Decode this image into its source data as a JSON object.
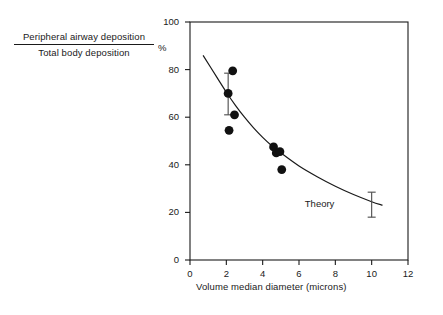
{
  "chart_data": {
    "type": "scatter",
    "title": "",
    "ylabel_numerator": "Peripheral airway deposition",
    "ylabel_denominator": "Total body deposition",
    "ylabel_unit": "%",
    "xlabel": "Volume median diameter  (microns)",
    "xlim": [
      0,
      12
    ],
    "ylim": [
      0,
      100
    ],
    "xticks": [
      0,
      2,
      4,
      6,
      8,
      10,
      12
    ],
    "yticks": [
      0,
      20,
      40,
      60,
      80,
      100
    ],
    "xtick_labels": [
      "0",
      "2",
      "4",
      "6",
      "8",
      "10",
      "12"
    ],
    "ytick_labels": [
      "0",
      "20",
      "40",
      "60",
      "80",
      "100"
    ],
    "grid": false,
    "legend_position": "none",
    "annotations": [
      {
        "text": "Theory",
        "x": 7.2,
        "y": 23
      }
    ],
    "series": [
      {
        "name": "Measured data",
        "type": "scatter",
        "marker": "filled-circle",
        "color": "#111111",
        "points": [
          {
            "x": 2.35,
            "y": 79.5
          },
          {
            "x": 2.1,
            "y": 70.0
          },
          {
            "x": 2.45,
            "y": 61.0
          },
          {
            "x": 2.15,
            "y": 54.5
          },
          {
            "x": 4.6,
            "y": 47.5
          },
          {
            "x": 4.75,
            "y": 45.0
          },
          {
            "x": 4.95,
            "y": 45.5
          },
          {
            "x": 5.05,
            "y": 38.0
          }
        ]
      },
      {
        "name": "Theory",
        "type": "line",
        "color": "#1a1a1a",
        "points": [
          {
            "x": 0.72,
            "y": 86.0
          },
          {
            "x": 1.5,
            "y": 76.5
          },
          {
            "x": 2.0,
            "y": 70.5
          },
          {
            "x": 2.5,
            "y": 65.0
          },
          {
            "x": 3.0,
            "y": 60.0
          },
          {
            "x": 3.5,
            "y": 55.5
          },
          {
            "x": 4.0,
            "y": 51.5
          },
          {
            "x": 4.5,
            "y": 48.0
          },
          {
            "x": 5.0,
            "y": 45.0
          },
          {
            "x": 6.0,
            "y": 39.5
          },
          {
            "x": 7.0,
            "y": 35.0
          },
          {
            "x": 8.0,
            "y": 31.0
          },
          {
            "x": 9.0,
            "y": 27.5
          },
          {
            "x": 10.0,
            "y": 24.5
          },
          {
            "x": 10.6,
            "y": 23.0
          }
        ]
      }
    ],
    "error_bars": [
      {
        "x": 2.1,
        "y": 70.0,
        "low": 61.0,
        "high": 78.5
      },
      {
        "x": 10.0,
        "y": 23.0,
        "low": 18.0,
        "high": 28.5
      }
    ]
  }
}
